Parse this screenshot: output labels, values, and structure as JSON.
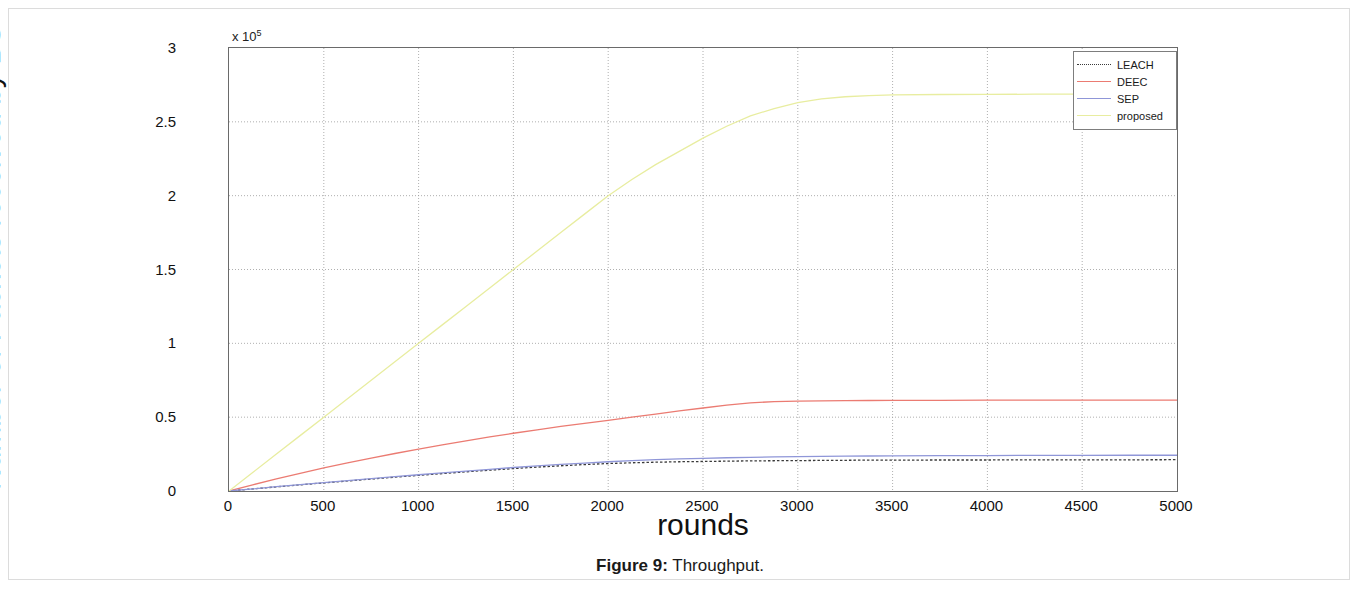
{
  "page": {
    "caption_label": "Figure 9:",
    "caption_text": "Throughput."
  },
  "chart_data": {
    "type": "line",
    "title": "",
    "xlabel": "rounds",
    "ylabel": "Number of Packets received by BS",
    "y_multiplier": "x 10",
    "y_multiplier_exp": "5",
    "xlim": [
      0,
      5000
    ],
    "ylim": [
      0,
      3
    ],
    "grid": true,
    "legend_position": "top-right",
    "xticks": [
      "0",
      "500",
      "1000",
      "1500",
      "2000",
      "2500",
      "3000",
      "3500",
      "4000",
      "4500",
      "5000"
    ],
    "xtick_values": [
      0,
      500,
      1000,
      1500,
      2000,
      2500,
      3000,
      3500,
      4000,
      4500,
      5000
    ],
    "yticks": [
      "0",
      "0.5",
      "1",
      "1.5",
      "2",
      "2.5",
      "3"
    ],
    "ytick_values": [
      0,
      0.5,
      1,
      1.5,
      2,
      2.5,
      3
    ],
    "x": [
      0,
      125,
      250,
      375,
      500,
      625,
      750,
      875,
      1000,
      1125,
      1250,
      1375,
      1500,
      1625,
      1750,
      1875,
      2000,
      2125,
      2250,
      2375,
      2500,
      2625,
      2750,
      2875,
      3000,
      3125,
      3250,
      3375,
      3500,
      3750,
      4000,
      4250,
      4500,
      4750,
      5000
    ],
    "series": [
      {
        "name": "LEACH",
        "color": "#3a3a3a",
        "style": "dotted",
        "values": [
          0.0,
          0.014,
          0.028,
          0.042,
          0.055,
          0.068,
          0.081,
          0.094,
          0.106,
          0.118,
          0.13,
          0.141,
          0.152,
          0.162,
          0.171,
          0.179,
          0.186,
          0.191,
          0.195,
          0.198,
          0.2,
          0.202,
          0.204,
          0.205,
          0.206,
          0.207,
          0.208,
          0.209,
          0.209,
          0.21,
          0.21,
          0.211,
          0.211,
          0.211,
          0.212
        ]
      },
      {
        "name": "DEEC",
        "color": "#eb7b72",
        "style": "solid",
        "values": [
          0.0,
          0.042,
          0.082,
          0.12,
          0.156,
          0.19,
          0.223,
          0.254,
          0.284,
          0.313,
          0.34,
          0.366,
          0.391,
          0.414,
          0.437,
          0.458,
          0.478,
          0.5,
          0.52,
          0.543,
          0.562,
          0.582,
          0.597,
          0.605,
          0.609,
          0.611,
          0.612,
          0.613,
          0.614,
          0.614,
          0.615,
          0.615,
          0.616,
          0.616,
          0.616
        ]
      },
      {
        "name": "SEP",
        "color": "#8f96d8",
        "style": "solid",
        "values": [
          0.0,
          0.014,
          0.029,
          0.043,
          0.057,
          0.07,
          0.084,
          0.097,
          0.11,
          0.123,
          0.135,
          0.147,
          0.159,
          0.17,
          0.18,
          0.189,
          0.198,
          0.206,
          0.212,
          0.217,
          0.221,
          0.225,
          0.228,
          0.231,
          0.233,
          0.235,
          0.236,
          0.237,
          0.238,
          0.239,
          0.24,
          0.241,
          0.241,
          0.242,
          0.242
        ]
      },
      {
        "name": "proposed",
        "color": "#e8eda0",
        "style": "solid",
        "values": [
          0.0,
          0.125,
          0.25,
          0.375,
          0.5,
          0.625,
          0.75,
          0.875,
          1.0,
          1.125,
          1.25,
          1.375,
          1.5,
          1.625,
          1.75,
          1.875,
          2.0,
          2.11,
          2.21,
          2.3,
          2.39,
          2.47,
          2.54,
          2.59,
          2.63,
          2.655,
          2.67,
          2.678,
          2.682,
          2.685,
          2.686,
          2.687,
          2.688,
          2.688,
          2.689
        ]
      }
    ]
  }
}
